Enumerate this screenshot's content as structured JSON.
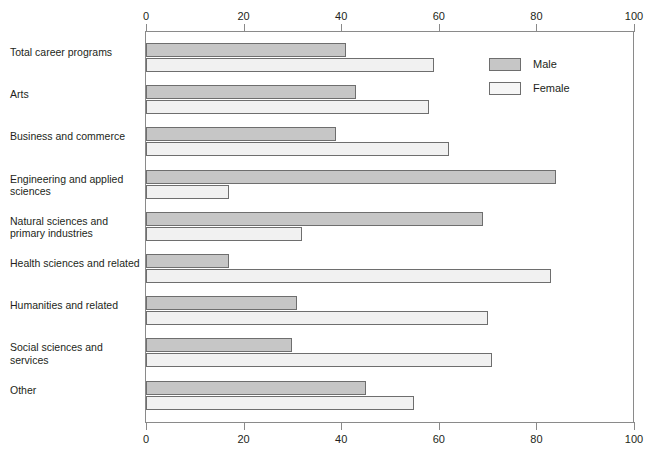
{
  "chart_data": {
    "type": "bar",
    "orientation": "horizontal",
    "title": "",
    "subtitle": "",
    "xlabel": "",
    "ylabel": "",
    "xlim": [
      0,
      100
    ],
    "xticks": [
      0,
      20,
      40,
      60,
      80,
      100
    ],
    "xtick_labels": [
      "0",
      "20",
      "40",
      "60",
      "80",
      "100"
    ],
    "grid": false,
    "axis_top": true,
    "axis_bottom": true,
    "legend_position": "top-right",
    "categories": [
      "Total career programs",
      "Arts",
      "Business and commerce",
      "Engineering and applied sciences",
      "Natural sciences and primary industries",
      "Health sciences and related",
      "Humanities and related",
      "Social sciences and services",
      "Other"
    ],
    "series": [
      {
        "name": "Male",
        "color": "#c6c6c6",
        "values": [
          41,
          43,
          39,
          84,
          69,
          17,
          31,
          30,
          45
        ]
      },
      {
        "name": "Female",
        "color": "#f1f1f1",
        "values": [
          59,
          58,
          62,
          17,
          32,
          83,
          70,
          71,
          55
        ]
      }
    ]
  },
  "legend": {
    "items": [
      {
        "label": "Male",
        "swatch": "male-swatch"
      },
      {
        "label": "Female",
        "swatch": "female-swatch"
      }
    ]
  },
  "axis": {
    "top_labels": [
      "0",
      "20",
      "40",
      "60",
      "80",
      "100"
    ],
    "bottom_labels": [
      "0",
      "20",
      "40",
      "60",
      "80",
      "100"
    ]
  }
}
